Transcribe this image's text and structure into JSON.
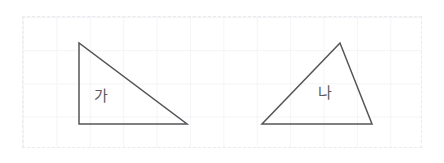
{
  "canvas": {
    "width": 444,
    "height": 163,
    "background_color": "#ffffff"
  },
  "grid": {
    "name": "graph-paper-panel",
    "x": 22,
    "y": 16,
    "width": 400,
    "height": 132,
    "cell_size": 33.4,
    "line_color": "#f4f4f7",
    "border_style": "dashed",
    "border_color": "#e9e9ee"
  },
  "style": {
    "stroke_color": "#555558",
    "stroke_width": 1.5,
    "fill": "none",
    "label_color": "#5a5a5e"
  },
  "figures": [
    {
      "id": "triangle-ga",
      "label": "가",
      "type": "right-triangle",
      "points": "79,43 79,124 187,124",
      "vertices": [
        {
          "x": 79,
          "y": 43
        },
        {
          "x": 79,
          "y": 124
        },
        {
          "x": 187,
          "y": 124
        }
      ],
      "base": 108,
      "height": 81,
      "right_angle_vertex": {
        "x": 79,
        "y": 124
      }
    },
    {
      "id": "triangle-na",
      "label": "나",
      "type": "scalene-triangle",
      "points": "340,43 262,124 372,124",
      "vertices": [
        {
          "x": 340,
          "y": 43
        },
        {
          "x": 262,
          "y": 124
        },
        {
          "x": 372,
          "y": 124
        }
      ],
      "base": 110,
      "height": 81,
      "apex_vertex": {
        "x": 340,
        "y": 43
      }
    }
  ]
}
